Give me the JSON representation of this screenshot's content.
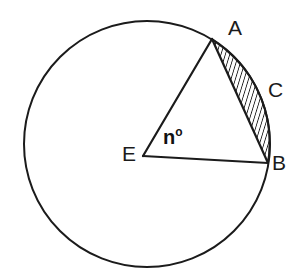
{
  "figure": {
    "type": "circle-geometry-diagram",
    "background_color": "#ffffff",
    "stroke_color": "#1b1b1b",
    "hatch_color": "#1b1b1b",
    "label_color": "#1b1b1b"
  },
  "circle": {
    "name": "circle-outline",
    "center_x": 147,
    "center_y": 144,
    "radius": 123,
    "stroke_width": 2.0
  },
  "points": {
    "E": {
      "label": "E",
      "x": 143,
      "y": 156,
      "role": "center"
    },
    "A": {
      "label": "A",
      "x": 212,
      "y": 39,
      "role": "on-circle"
    },
    "B": {
      "label": "B",
      "x": 268,
      "y": 163,
      "role": "on-circle"
    },
    "C": {
      "label": "C",
      "x": 270,
      "y": 92,
      "role": "arc-midpoint"
    }
  },
  "segments": [
    {
      "name": "radius-EA",
      "from": "E",
      "to": "A"
    },
    {
      "name": "radius-EB",
      "from": "E",
      "to": "B"
    },
    {
      "name": "chord-AB",
      "from": "A",
      "to": "B"
    }
  ],
  "shaded_region": {
    "name": "circular-segment-ACB",
    "bounded_by": [
      "chord-AB",
      "arc-ACB"
    ],
    "fill": "diagonal-hatch",
    "hatch_spacing": 4.2,
    "hatch_angle_deg": 17
  },
  "labels": {
    "point_a": "A",
    "point_b": "B",
    "point_c": "C",
    "point_e": "E",
    "angle_value": "n",
    "angle_unit": "o"
  }
}
